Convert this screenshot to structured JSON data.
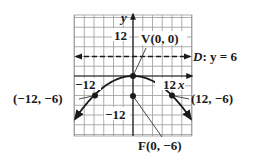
{
  "chart_data": {
    "type": "line",
    "title": "",
    "equation": "x^2 = -24y",
    "xlabel": "x",
    "ylabel": "y",
    "xlim": [
      -18,
      18
    ],
    "ylim": [
      -18,
      18
    ],
    "grid": true,
    "grid_step": 3,
    "tick_labels": {
      "x": [
        "-12",
        "12"
      ],
      "y": [
        "12",
        "-12"
      ]
    },
    "series": [
      {
        "name": "parabola",
        "x": [
          -18,
          -12,
          -6,
          0,
          6,
          12,
          18
        ],
        "y": [
          -13.5,
          -6,
          -1.5,
          0,
          -1.5,
          -6,
          -13.5
        ]
      }
    ],
    "points": [
      {
        "label": "V(0, 0)",
        "x": 0,
        "y": 0
      },
      {
        "label": "F(0, -6)",
        "x": 0,
        "y": -6
      },
      {
        "label": "(-12, -6)",
        "x": -12,
        "y": -6
      },
      {
        "label": "(12, -6)",
        "x": 12,
        "y": -6
      }
    ],
    "directrix": {
      "label": "D: y = 6",
      "y": 6,
      "style": "dashed"
    }
  },
  "labels": {
    "y_axis": "y",
    "x_axis": "x",
    "y_tick_top": "12",
    "y_tick_bottom": "−12",
    "x_tick_left": "−12",
    "x_tick_right": "12",
    "vertex": "V(0, 0)",
    "focus": "F(0, −6)",
    "left_point": "(−12, −6)",
    "right_point": "(12, −6)",
    "directrix_D": "D",
    "directrix_rest": ": y = 6"
  }
}
